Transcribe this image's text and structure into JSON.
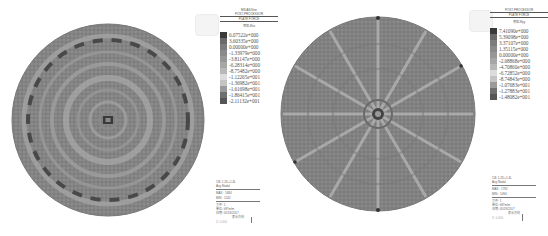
{
  "left_panel": {
    "header": {
      "line1": "MIDAS/Gen",
      "line2": "POST-PROCESSOR",
      "line3": "PLATE FORCE",
      "unit": "弯矩-Mxx"
    },
    "legend": [
      {
        "value": "6.07522e+000",
        "color": "#3a3a3a"
      },
      {
        "value": "3.60335e+000",
        "color": "#6a6a6a"
      },
      {
        "value": "0.00000e+000",
        "color": "#7c7c7c"
      },
      {
        "value": "-1.33979e+000",
        "color": "#8a8a8a"
      },
      {
        "value": "-3.81147e+000",
        "color": "#979797"
      },
      {
        "value": "-6.28314e+000",
        "color": "#a6a6a6"
      },
      {
        "value": "-8.75482e+000",
        "color": "#b8b8b8"
      },
      {
        "value": "-1.12265e+001",
        "color": "#dcdcdc"
      },
      {
        "value": "-1.36982e+001",
        "color": "#c4c4c4"
      },
      {
        "value": "-1.61698e+001",
        "color": "#9a9a9a"
      },
      {
        "value": "-1.86415e+001",
        "color": "#6e6e6e"
      },
      {
        "value": "-2.11132e+001",
        "color": "#555555"
      }
    ],
    "info": {
      "line1": "CB: 1.2D+1.4L",
      "line2": "Avg Nodal",
      "line3": "MAX : 1684",
      "line4": "MIN : 1242",
      "line5": "文件: 1",
      "line6": "单位: kN*m/m",
      "line7": "日期: 05/18/2017",
      "line8": "表示-方向",
      "line9": "X: 0.000"
    }
  },
  "right_panel": {
    "header": {
      "line1": "POST-PROCESSOR",
      "line2": "PLATE FORCE",
      "unit": "弯矩-Myy"
    },
    "legend": [
      {
        "value": "7.41090e+000",
        "color": "#3a3a3a"
      },
      {
        "value": "5.39098e+000",
        "color": "#6a6a6a"
      },
      {
        "value": "3.37107e+000",
        "color": "#7c7c7c"
      },
      {
        "value": "1.35115e+000",
        "color": "#8a8a8a"
      },
      {
        "value": "0.00000e+000",
        "color": "#979797"
      },
      {
        "value": "-2.68868e+000",
        "color": "#a6a6a6"
      },
      {
        "value": "-4.70860e+000",
        "color": "#b8b8b8"
      },
      {
        "value": "-6.72852e+000",
        "color": "#dcdcdc"
      },
      {
        "value": "-8.74843e+000",
        "color": "#c4c4c4"
      },
      {
        "value": "-1.07683e+001",
        "color": "#9a9a9a"
      },
      {
        "value": "-1.27883e+001",
        "color": "#6e6e6e"
      },
      {
        "value": "-1.48082e+001",
        "color": "#555555"
      }
    ],
    "info": {
      "line1": "CB: 1.2D+1.4L",
      "line2": "Avg Nodal",
      "line3": "MAX : 1792",
      "line4": "MIN : 1094",
      "line5": "文件: 1",
      "line6": "单位: kN*m/m",
      "line7": "日期: 05/18/2017",
      "line8": "表示-方向",
      "line9": "X: 0.000"
    }
  }
}
